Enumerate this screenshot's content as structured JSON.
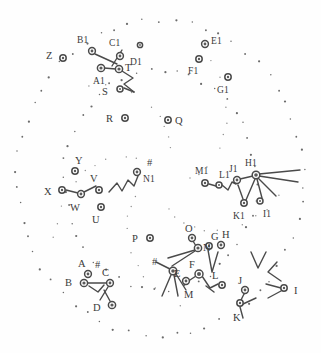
{
  "figure": {
    "title": "",
    "background_color": "#fefefe",
    "ink_color": "#4a4a4a",
    "label_color": "#3a3a3a",
    "width": 321,
    "height": 353
  },
  "chart_data": {
    "type": "scatter",
    "title": "",
    "xlabel": "",
    "ylabel": "",
    "xlim": [
      0,
      321
    ],
    "ylim": [
      0,
      353
    ],
    "grid": false,
    "legend": null,
    "rings": [
      {
        "name": "outer-ring",
        "cx": 160,
        "cy": 178,
        "rx": 143,
        "ry": 158,
        "dots": 58,
        "style": "dotted"
      },
      {
        "name": "inner-ring",
        "cx": 160,
        "cy": 180,
        "rx": 96,
        "ry": 110,
        "dots": 44,
        "style": "dotted"
      }
    ],
    "points": [
      {
        "label": "Z",
        "x": 63,
        "y": 58,
        "r": 3.2,
        "lx": -11,
        "ly": -2
      },
      {
        "label": "B1",
        "x": 92,
        "y": 51,
        "r": 3.4,
        "lx": -9,
        "ly": -10
      },
      {
        "label": "C1",
        "x": 120,
        "y": 56,
        "r": 3.4,
        "lx": -5,
        "ly": -12
      },
      {
        "label": "D1",
        "x": 140,
        "y": 45,
        "r": 2.6,
        "lx": -4,
        "ly": 18
      },
      {
        "label": "T",
        "x": 119,
        "y": 69,
        "r": 3.6,
        "lx": 6,
        "ly": -1
      },
      {
        "label": "A1",
        "x": 101,
        "y": 68,
        "r": 3.6,
        "lx": -2,
        "ly": 14
      },
      {
        "label": "S",
        "x": 120,
        "y": 89,
        "r": 3.0,
        "lx": -12,
        "ly": 3
      },
      {
        "label": "R",
        "x": 125,
        "y": 118,
        "r": 3.2,
        "lx": -13,
        "ly": 1
      },
      {
        "label": "Q",
        "x": 168,
        "y": 120,
        "r": 3.2,
        "lx": 7,
        "ly": 1
      },
      {
        "label": "E1",
        "x": 205,
        "y": 44,
        "r": 3.4,
        "lx": 6,
        "ly": -2
      },
      {
        "label": "F1",
        "x": 199,
        "y": 59,
        "r": 3.2,
        "lx": -5,
        "ly": 13
      },
      {
        "label": "G1",
        "x": 228,
        "y": 77,
        "r": 3.2,
        "lx": -5,
        "ly": 14
      },
      {
        "label": "Y",
        "x": 75,
        "y": 171,
        "r": 3.2,
        "lx": 0,
        "ly": -10
      },
      {
        "label": "X",
        "x": 62,
        "y": 190,
        "r": 3.2,
        "lx": -12,
        "ly": 2
      },
      {
        "label": "W",
        "x": 81,
        "y": 194,
        "r": 3.4,
        "lx": -5,
        "ly": 14
      },
      {
        "label": "V",
        "x": 99,
        "y": 190,
        "r": 3.2,
        "lx": -3,
        "ly": -11
      },
      {
        "label": "U",
        "x": 101,
        "y": 207,
        "r": 3.2,
        "lx": -3,
        "ly": 13
      },
      {
        "label": "N1",
        "x": 137,
        "y": 172,
        "r": 3.4,
        "lx": 6,
        "ly": 8
      },
      {
        "label": "#",
        "x": 147,
        "y": 163,
        "r": 0,
        "lx": 0,
        "ly": 0
      },
      {
        "label": "M1",
        "x": 205,
        "y": 183,
        "r": 3.2,
        "lx": -4,
        "ly": -11
      },
      {
        "label": "L1",
        "x": 219,
        "y": 185,
        "r": 3.0,
        "lx": 0,
        "ly": -9
      },
      {
        "label": "J1",
        "x": 237,
        "y": 180,
        "r": 3.4,
        "lx": -2,
        "ly": -10
      },
      {
        "label": "H1",
        "x": 256,
        "y": 175,
        "r": 3.8,
        "lx": -5,
        "ly": -11
      },
      {
        "label": "K1",
        "x": 244,
        "y": 203,
        "r": 3.2,
        "lx": -5,
        "ly": 14
      },
      {
        "label": "I1",
        "x": 260,
        "y": 201,
        "r": 3.0,
        "lx": 3,
        "ly": 14
      },
      {
        "label": "P",
        "x": 150,
        "y": 238,
        "r": 3.2,
        "lx": -12,
        "ly": 1
      },
      {
        "label": "#",
        "x": 152,
        "y": 262,
        "r": 0,
        "lx": 0,
        "ly": 0
      },
      {
        "label": "O",
        "x": 192,
        "y": 238,
        "r": 3.4,
        "lx": -1,
        "ly": -9
      },
      {
        "label": "N",
        "x": 198,
        "y": 248,
        "r": 3.6,
        "lx": 5,
        "ly": 0
      },
      {
        "label": "G",
        "x": 209,
        "y": 246,
        "r": 3.2,
        "lx": 2,
        "ly": -9
      },
      {
        "label": "H",
        "x": 221,
        "y": 245,
        "r": 3.4,
        "lx": 1,
        "ly": -10
      },
      {
        "label": "E",
        "x": 186,
        "y": 281,
        "r": 3.4,
        "lx": -6,
        "ly": -7
      },
      {
        "label": "F",
        "x": 199,
        "y": 274,
        "r": 4.0,
        "lx": -4,
        "ly": -9
      },
      {
        "label": "M",
        "x": 173,
        "y": 271,
        "r": 3.8,
        "lx": 11,
        "ly": 24
      },
      {
        "label": "L",
        "x": 222,
        "y": 285,
        "r": 3.2,
        "lx": -4,
        "ly": -9
      },
      {
        "label": "J",
        "x": 245,
        "y": 290,
        "r": 3.4,
        "lx": -1,
        "ly": -9
      },
      {
        "label": "K",
        "x": 240,
        "y": 303,
        "r": 3.2,
        "lx": -1,
        "ly": 15
      },
      {
        "label": "I",
        "x": 284,
        "y": 288,
        "r": 3.2,
        "lx": 10,
        "ly": 3
      },
      {
        "label": "A",
        "x": 88,
        "y": 274,
        "r": 3.4,
        "lx": -4,
        "ly": -10
      },
      {
        "label": "#",
        "x": 95,
        "y": 265,
        "r": 0,
        "lx": 0,
        "ly": 0
      },
      {
        "label": "B",
        "x": 84,
        "y": 283,
        "r": 3.6,
        "lx": -13,
        "ly": 0
      },
      {
        "label": "C",
        "x": 110,
        "y": 283,
        "r": 3.4,
        "lx": -2,
        "ly": -10
      },
      {
        "label": "D",
        "x": 112,
        "y": 305,
        "r": 3.6,
        "lx": -13,
        "ly": 3
      }
    ],
    "connectors": [
      {
        "from": "B1-region",
        "path": "M95,54 L117,64"
      },
      {
        "from": "C1-arrow",
        "path": "M122,50 L112,66"
      },
      {
        "from": "A1-T",
        "path": "M104,68 L116,69"
      },
      {
        "from": "T-zigzag",
        "path": "M122,71 L133,78 L124,84 L134,92"
      },
      {
        "from": "S-stem",
        "path": "M124,88 L134,92"
      },
      {
        "from": "X-W",
        "path": "M66,190 L78,193"
      },
      {
        "from": "W-tail",
        "path": "M84,192 L96,186"
      },
      {
        "from": "N1-zigzag",
        "path": "M109,192 L117,183 L122,191 L128,180 L134,186 L138,176"
      },
      {
        "from": "M1-L1",
        "path": "M209,184 L216,186"
      },
      {
        "from": "L1-J1",
        "path": "M222,185 L228,190 L232,182 L236,184"
      },
      {
        "from": "J1-K1",
        "path": "M238,185 L243,199"
      },
      {
        "from": "J1-H1",
        "path": "M240,179 L253,176"
      },
      {
        "from": "H1-ray1",
        "path": "M259,174 L300,170"
      },
      {
        "from": "H1-ray2",
        "path": "M259,176 L298,182"
      },
      {
        "from": "H1-ray3",
        "path": "M258,178 L276,196"
      },
      {
        "from": "H1-ray4",
        "path": "M257,179 L262,198"
      },
      {
        "from": "H1-ray5",
        "path": "M255,179 L246,200"
      },
      {
        "from": "O-N",
        "path": "M193,241 L196,246"
      },
      {
        "from": "N-ray1",
        "path": "M195,250 L168,258"
      },
      {
        "from": "N-ray2",
        "path": "M195,251 L172,266"
      },
      {
        "from": "M-ray1",
        "path": "M171,275 L162,296"
      },
      {
        "from": "M-ray2",
        "path": "M174,275 L178,296"
      },
      {
        "from": "M-ray3",
        "path": "M176,274 L186,290"
      },
      {
        "from": "M-ray4",
        "path": "M170,269 L156,262"
      },
      {
        "from": "G-fork",
        "path": "M208,250 L212,272 L218,252"
      },
      {
        "from": "E-F",
        "path": "M190,280 L196,276"
      },
      {
        "from": "F-L",
        "path": "M202,276 L210,288 L218,284"
      },
      {
        "from": "L-tail",
        "path": "M206,286 L214,292"
      },
      {
        "from": "J-K",
        "path": "M244,294 L241,300"
      },
      {
        "from": "K-ray1",
        "path": "M243,304 L256,298"
      },
      {
        "from": "K-ray2",
        "path": "M240,307 L243,318"
      },
      {
        "from": "I-ray1",
        "path": "M281,288 L266,284"
      },
      {
        "from": "I-ray2",
        "path": "M281,291 L268,298"
      },
      {
        "from": "B-C",
        "path": "M88,283 L106,283"
      },
      {
        "from": "B-zig",
        "path": "M89,286 L98,292 L104,285"
      },
      {
        "from": "C-D",
        "path": "M108,287 L100,300"
      },
      {
        "from": "D-stem",
        "path": "M104,290 L110,301"
      },
      {
        "from": "chev-1",
        "path": "M251,252 L258,268 L266,252"
      },
      {
        "from": "chev-2",
        "path": "M277,262 L268,272 L281,281"
      }
    ]
  }
}
